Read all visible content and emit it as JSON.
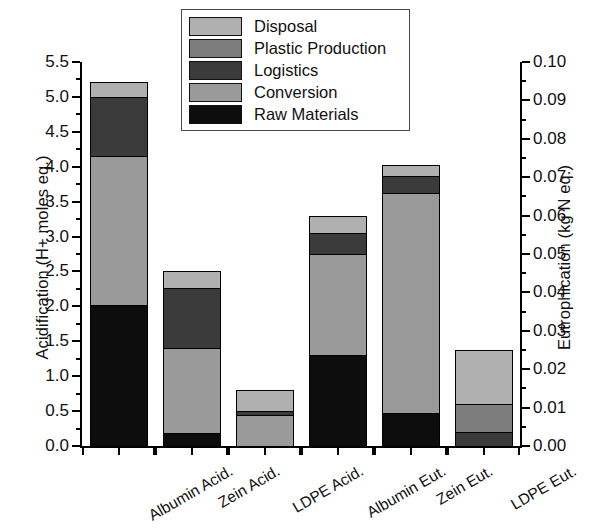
{
  "chart_data": {
    "type": "bar",
    "stacked": true,
    "title": "",
    "categories": [
      "Albumin Acid.",
      "Zein Acid.",
      "LDPE Acid.",
      "Albumin Eut.",
      "Zein Eut.",
      "LDPE Eut."
    ],
    "series": [
      {
        "name": "Raw Materials",
        "color": "#0d0d0d",
        "values": [
          2.02,
          0.19,
          0.0,
          1.3,
          0.47,
          0.0
        ]
      },
      {
        "name": "Conversion",
        "color": "#9a9a9a",
        "values": [
          2.14,
          1.21,
          0.45,
          1.45,
          3.15,
          0.0
        ]
      },
      {
        "name": "Logistics",
        "color": "#3b3b3b",
        "values": [
          0.84,
          0.86,
          0.05,
          0.3,
          0.25,
          0.2
        ]
      },
      {
        "name": "Plastic Production",
        "color": "#7d7d7d",
        "values": [
          0.0,
          0.0,
          0.0,
          0.0,
          0.0,
          0.4
        ]
      },
      {
        "name": "Disposal",
        "color": "#b0b0b0",
        "values": [
          0.22,
          0.25,
          0.3,
          0.25,
          0.16,
          0.78
        ]
      }
    ],
    "totals_left_axis_units": [
      5.22,
      2.51,
      0.8,
      3.3,
      4.03,
      1.38
    ],
    "stack_order_bottom_to_top": [
      "Raw Materials",
      "Conversion",
      "Logistics",
      "Plastic Production",
      "Disposal"
    ],
    "grid": false,
    "legend_position": "top-center",
    "y_left": {
      "label": "Acidification (H+ moles eq.)",
      "min": 0.0,
      "max": 5.5,
      "tick_step": 0.5,
      "ticks": [
        "0.0",
        "0.5",
        "1.0",
        "1.5",
        "2.0",
        "2.5",
        "3.0",
        "3.5",
        "4.0",
        "4.5",
        "5.0",
        "5.5"
      ]
    },
    "y_right": {
      "label": "Eutrophication (kg N eq.)",
      "min": 0.0,
      "max": 0.1,
      "tick_step": 0.01,
      "ticks": [
        "0.00",
        "0.01",
        "0.02",
        "0.03",
        "0.04",
        "0.05",
        "0.06",
        "0.07",
        "0.08",
        "0.09",
        "0.10"
      ]
    },
    "xlabel": ""
  },
  "legend": {
    "items": [
      {
        "label": "Disposal",
        "color": "#b0b0b0"
      },
      {
        "label": "Plastic Production",
        "color": "#7d7d7d"
      },
      {
        "label": "Logistics",
        "color": "#3b3b3b"
      },
      {
        "label": "Conversion",
        "color": "#9a9a9a"
      },
      {
        "label": "Raw Materials",
        "color": "#0d0d0d"
      }
    ]
  }
}
